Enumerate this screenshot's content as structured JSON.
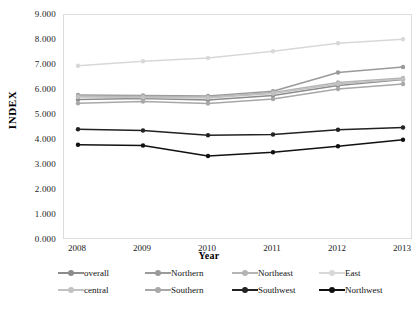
{
  "chart_data": {
    "type": "line",
    "title": "",
    "xlabel": "Year",
    "ylabel": "INDEX",
    "categories": [
      "2008",
      "2009",
      "2010",
      "2011",
      "2012",
      "2013"
    ],
    "x": [
      2008,
      2009,
      2010,
      2011,
      2012,
      2013
    ],
    "ylim": [
      0,
      9
    ],
    "ytick_labels": [
      "0.000",
      "1.000",
      "2.000",
      "3.000",
      "4.000",
      "5.000",
      "6.000",
      "7.000",
      "8.000",
      "9.000"
    ],
    "ytick_values": [
      0,
      1,
      2,
      3,
      4,
      5,
      6,
      7,
      8,
      9
    ],
    "grid": false,
    "legend_position": "bottom",
    "marker": "circle",
    "series": [
      {
        "name": "overall",
        "color": "#8c8c8c",
        "values": [
          5.62,
          5.66,
          5.6,
          5.78,
          6.18,
          6.42
        ]
      },
      {
        "name": "Northern",
        "color": "#9a9a9a",
        "values": [
          5.8,
          5.78,
          5.76,
          5.95,
          6.7,
          6.92
        ]
      },
      {
        "name": "Northeast",
        "color": "#b4b4b4",
        "values": [
          5.75,
          5.74,
          5.72,
          5.9,
          6.3,
          6.48
        ]
      },
      {
        "name": "East",
        "color": "#d8d8d8",
        "values": [
          6.97,
          7.15,
          7.28,
          7.55,
          7.87,
          8.03
        ]
      },
      {
        "name": "central",
        "color": "#c2c2c2",
        "values": [
          5.72,
          5.7,
          5.68,
          5.86,
          6.24,
          6.44
        ]
      },
      {
        "name": "Southern",
        "color": "#a8a8a8",
        "values": [
          5.47,
          5.54,
          5.46,
          5.64,
          6.04,
          6.24
        ]
      },
      {
        "name": "Southwest",
        "color": "#222222",
        "values": [
          4.43,
          4.38,
          4.19,
          4.22,
          4.41,
          4.5
        ]
      },
      {
        "name": "Northwest",
        "color": "#111111",
        "values": [
          3.81,
          3.78,
          3.36,
          3.51,
          3.75,
          4.01
        ]
      }
    ]
  },
  "legend": {
    "rows": [
      [
        "overall",
        "Northern",
        "Northeast",
        "East"
      ],
      [
        "central",
        "Southern",
        "Southwest",
        "Northwest"
      ]
    ]
  }
}
